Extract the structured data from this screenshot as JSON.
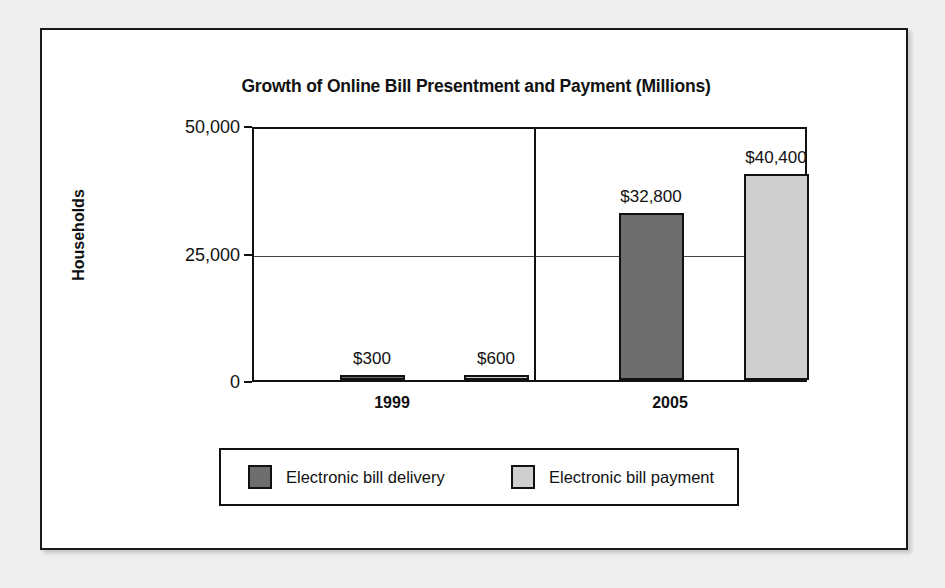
{
  "chart_data": {
    "type": "bar",
    "title": "Growth of Online Bill Presentment and Payment (Millions)",
    "xlabel": "",
    "ylabel": "Households",
    "categories": [
      "1999",
      "2005"
    ],
    "ylim": [
      0,
      50000
    ],
    "yticks": [
      "0",
      "25,000",
      "50,000"
    ],
    "grid": true,
    "legend_position": "bottom",
    "series": [
      {
        "name": "Electronic bill delivery",
        "color": "#6e6e6e",
        "values": [
          300,
          600
        ],
        "labels": [
          "$300",
          "$32,800"
        ]
      },
      {
        "name": "Electronic bill payment",
        "color": "#cfcfcf",
        "values": [
          600,
          40400
        ],
        "labels": [
          "$600",
          "$40,400"
        ]
      }
    ],
    "bars": [
      {
        "group": "1999",
        "series": "Electronic bill delivery",
        "value": 300,
        "label": "$300",
        "color": "#6e6e6e"
      },
      {
        "group": "1999",
        "series": "Electronic bill payment",
        "value": 600,
        "label": "$600",
        "color": "#cfcfcf"
      },
      {
        "group": "2005",
        "series": "Electronic bill delivery",
        "value": 32800,
        "label": "$32,800",
        "color": "#6e6e6e"
      },
      {
        "group": "2005",
        "series": "Electronic bill payment",
        "value": 40400,
        "label": "$40,400",
        "color": "#cfcfcf"
      }
    ]
  },
  "chart": {
    "title": "Growth of Online Bill Presentment and Payment (Millions)",
    "y_axis_title": "Households",
    "y_ticks": {
      "top": "50,000",
      "middle": "25,000",
      "bottom": "0"
    },
    "x_labels": [
      "1999",
      "2005"
    ],
    "bar_labels": [
      "$300",
      "$600",
      "$32,800",
      "$40,400"
    ],
    "legend": [
      {
        "label": "Electronic bill delivery",
        "color": "#6e6e6e"
      },
      {
        "label": "Electronic bill payment",
        "color": "#cfcfcf"
      }
    ],
    "colors": {
      "series_dark": "#6e6e6e",
      "series_light": "#cfcfcf",
      "outline": "#111111",
      "background": "#ffffff",
      "page": "#efefef"
    }
  }
}
